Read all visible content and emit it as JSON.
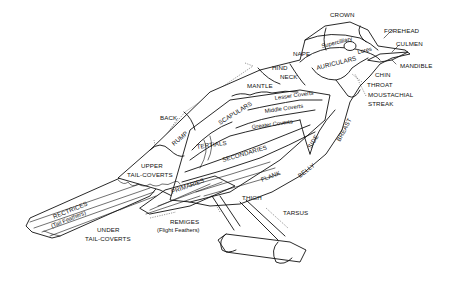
{
  "diagram": {
    "labels": {
      "crown": "CROWN",
      "forehead": "FOREHEAD",
      "culmen": "CULMEN",
      "supercilliary": "Supercilliary",
      "lores": "Lores",
      "nape": "NAPE",
      "auriculars": "AURICULARS",
      "mandible": "MANDIBLE",
      "chin": "CHIN",
      "throat": "THROAT",
      "moustachial_1": "MOUSTACHIAL",
      "moustachial_2": "STREAK",
      "hind_neck_1": "HIND",
      "hind_neck_2": "NECK",
      "mantle": "MANTLE",
      "lesser_coverts": "Lesser Coverts",
      "middle_coverts": "Middle Coverts",
      "greater_coverts": "Greater Coverts",
      "scapulars": "SCAPULARS",
      "back": "BACK",
      "rump": "RUMP",
      "tertials": "TERTIALS",
      "secondaries": "SECONDARIES",
      "side": "SIDE",
      "breast": "BREAST",
      "belly": "BELLY",
      "flank": "FLANK",
      "upper_tail_coverts_1": "UPPER",
      "upper_tail_coverts_2": "TAIL-COVERTS",
      "primaries": "PRIMARIES",
      "rectrices_1": "RECTRICES",
      "rectrices_2": "(Tail Feathers)",
      "under_tail_coverts_1": "UNDER",
      "under_tail_coverts_2": "TAIL-COVERTS",
      "remiges_1": "REMIGES",
      "remiges_2": "(Flight Feathers)",
      "thigh": "THIGH",
      "tarsus": "TARSUS"
    }
  }
}
